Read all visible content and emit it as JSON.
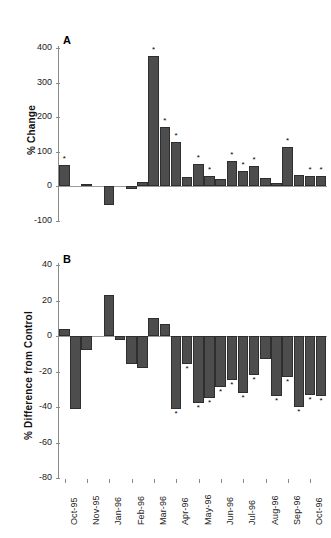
{
  "figure": {
    "background": "#ffffff",
    "bar_color": "#4d4d4d",
    "axis_color": "#8a8a8a",
    "significance_marker": "*"
  },
  "chart_data": [
    {
      "type": "bar",
      "panel": "A",
      "title": "",
      "xlabel": "",
      "ylabel": "% Change",
      "ylim": [
        -100,
        400
      ],
      "yticks": [
        -100,
        0,
        100,
        200,
        300,
        400
      ],
      "yticklabels": [
        "-100",
        "0",
        "100",
        "200",
        "300",
        "400"
      ],
      "grid": false,
      "legend": "none",
      "categories": [
        "Oct-95",
        "Nov-95",
        "Nov-95",
        "Dec-95",
        "Jan-96",
        "Jan-96",
        "Feb-96",
        "Feb-96",
        "Mar-96",
        "Mar-96",
        "Apr-96",
        "Apr-96",
        "May-96",
        "May-96",
        "Jun-96",
        "Jun-96",
        "Jul-96",
        "Jul-96",
        "Aug-96",
        "Aug-96",
        "Sep-96",
        "Sep-96",
        "Oct-96",
        "Oct-96"
      ],
      "values": [
        60,
        0,
        7,
        0,
        -55,
        0,
        -8,
        13,
        377,
        172,
        128,
        25,
        63,
        30,
        19,
        73,
        44,
        58,
        24,
        8,
        113,
        33,
        30,
        29
      ],
      "significant": [
        true,
        false,
        false,
        false,
        false,
        false,
        false,
        false,
        true,
        true,
        true,
        false,
        true,
        true,
        false,
        true,
        true,
        true,
        false,
        false,
        true,
        false,
        true,
        true
      ]
    },
    {
      "type": "bar",
      "panel": "B",
      "title": "",
      "xlabel": "",
      "ylabel": "% Difference from Control",
      "ylim": [
        -80,
        40
      ],
      "yticks": [
        -80,
        -60,
        -40,
        -20,
        0,
        20,
        40
      ],
      "yticklabels": [
        "-80",
        "-60",
        "-40",
        "-20",
        "0",
        "20",
        "40"
      ],
      "grid": false,
      "legend": "none",
      "categories": [
        "Oct-95",
        "Nov-95",
        "Nov-95",
        "Dec-95",
        "Jan-96",
        "Jan-96",
        "Feb-96",
        "Feb-96",
        "Mar-96",
        "Mar-96",
        "Apr-96",
        "Apr-96",
        "May-96",
        "May-96",
        "Jun-96",
        "Jun-96",
        "Jul-96",
        "Jul-96",
        "Aug-96",
        "Aug-96",
        "Sep-96",
        "Sep-96",
        "Oct-96",
        "Oct-96"
      ],
      "values": [
        4,
        -41,
        -8,
        0,
        23,
        -2,
        -16,
        -18,
        10,
        7,
        -41,
        -16,
        -38,
        -35,
        -29,
        -25,
        -32,
        -22,
        -13,
        -34,
        -23,
        -40,
        -33,
        -34
      ],
      "significant": [
        false,
        false,
        false,
        false,
        false,
        false,
        false,
        false,
        false,
        false,
        true,
        true,
        true,
        true,
        true,
        true,
        true,
        true,
        false,
        true,
        true,
        true,
        true,
        true
      ],
      "xticklabels": [
        "Oct-95",
        "Nov-95",
        "Jan-96",
        "Feb-96",
        "Mar-96",
        "Apr-96",
        "May-96",
        "Jun-96",
        "Jul-96",
        "Aug-96",
        "Sep-96",
        "Oct-96"
      ]
    }
  ],
  "panel_a": {
    "letter": "A",
    "ylabel": "% Change"
  },
  "panel_b": {
    "letter": "B",
    "ylabel": "% Difference from Control"
  }
}
